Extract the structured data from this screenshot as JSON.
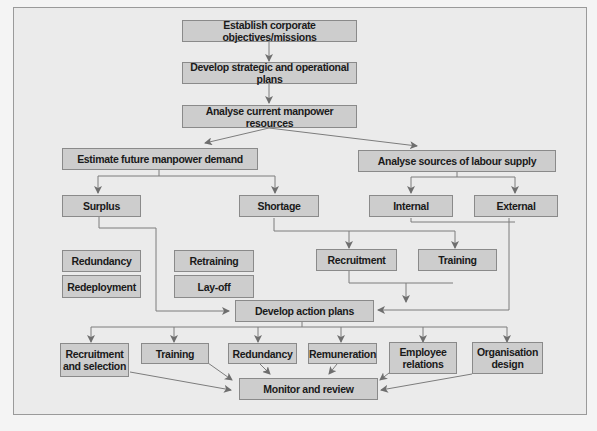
{
  "diagram": {
    "type": "flowchart",
    "nodes": {
      "establish": "Establish corporate objectives/missions",
      "develop_plans": "Develop strategic and operational plans",
      "analyse_current": "Analyse current manpower resources",
      "estimate_demand": "Estimate future manpower demand",
      "analyse_supply": "Analyse sources of labour supply",
      "surplus": "Surplus",
      "shortage": "Shortage",
      "internal": "Internal",
      "external": "External",
      "redundancy_1": "Redundancy",
      "redeployment": "Redeployment",
      "retraining": "Retraining",
      "layoff": "Lay-off",
      "recruitment_1": "Recruitment",
      "training_1": "Training",
      "action_plans": "Develop action plans",
      "recruitment_selection": "Recruitment\nand selection",
      "training_2": "Training",
      "redundancy_2": "Redundancy",
      "remuneration": "Remuneration",
      "employee_relations": "Employee\nrelations",
      "organisation_design": "Organisation\ndesign",
      "monitor": "Monitor and review"
    },
    "edges": [
      [
        "Establish corporate objectives/missions",
        "Develop strategic and operational plans"
      ],
      [
        "Develop strategic and operational plans",
        "Analyse current manpower resources"
      ],
      [
        "Analyse current manpower resources",
        "Estimate future manpower demand"
      ],
      [
        "Analyse current manpower resources",
        "Analyse sources of labour supply"
      ],
      [
        "Estimate future manpower demand",
        "Surplus"
      ],
      [
        "Estimate future manpower demand",
        "Shortage"
      ],
      [
        "Analyse sources of labour supply",
        "Internal"
      ],
      [
        "Analyse sources of labour supply",
        "External"
      ],
      [
        "Surplus",
        "Develop action plans"
      ],
      [
        "Shortage",
        "Recruitment"
      ],
      [
        "Shortage",
        "Training"
      ],
      [
        "Internal",
        "Training"
      ],
      [
        "External",
        "Develop action plans"
      ],
      [
        "Recruitment",
        "Develop action plans"
      ],
      [
        "Training",
        "Develop action plans"
      ],
      [
        "Develop action plans",
        "Recruitment and selection"
      ],
      [
        "Develop action plans",
        "Training"
      ],
      [
        "Develop action plans",
        "Redundancy"
      ],
      [
        "Develop action plans",
        "Remuneration"
      ],
      [
        "Develop action plans",
        "Employee relations"
      ],
      [
        "Develop action plans",
        "Organisation design"
      ],
      [
        "Recruitment and selection",
        "Monitor and review"
      ],
      [
        "Training",
        "Monitor and review"
      ],
      [
        "Redundancy",
        "Monitor and review"
      ],
      [
        "Remuneration",
        "Monitor and review"
      ],
      [
        "Employee relations",
        "Monitor and review"
      ],
      [
        "Organisation design",
        "Monitor and review"
      ]
    ],
    "colors": {
      "box_fill": "#cdcdcd",
      "box_border": "#8a8a8a",
      "line": "#7a7a7a",
      "background": "#ebebeb"
    }
  }
}
